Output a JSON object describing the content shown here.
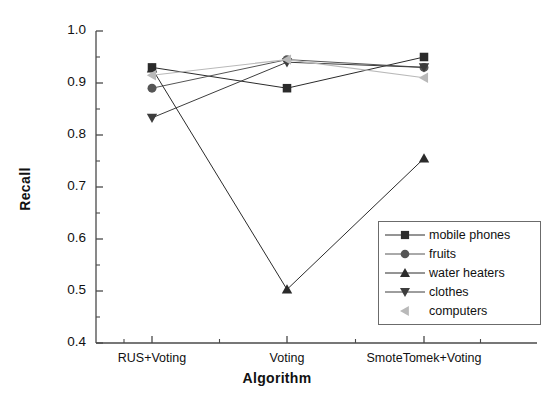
{
  "chart_data": {
    "type": "line",
    "title": "",
    "xlabel": "Algorithm",
    "ylabel": "Recall",
    "categories": [
      "RUS+Voting",
      "Voting",
      "SmoteTomek+Voting"
    ],
    "ylim": [
      0.4,
      1.0
    ],
    "ytick_labels": [
      "0.4",
      "0.5",
      "0.6",
      "0.7",
      "0.8",
      "0.9",
      "1.0"
    ],
    "ytick_values": [
      0.4,
      0.5,
      0.6,
      0.7,
      0.8,
      0.9,
      1.0
    ],
    "ytick_minor_values": [
      0.45,
      0.55,
      0.65,
      0.75,
      0.85,
      0.95
    ],
    "grid": false,
    "legend_position": "lower-right-inside",
    "series": [
      {
        "name": "mobile phones",
        "marker": "square",
        "color": "#2b2b2b",
        "values": [
          0.93,
          0.89,
          0.95
        ]
      },
      {
        "name": "fruits",
        "marker": "circle",
        "color": "#555555",
        "values": [
          0.89,
          0.945,
          0.93
        ]
      },
      {
        "name": "water heaters",
        "marker": "triangle-up",
        "color": "#2b2b2b",
        "values": [
          0.928,
          0.503,
          0.755
        ]
      },
      {
        "name": "clothes",
        "marker": "triangle-down",
        "color": "#3d3d3d",
        "values": [
          0.833,
          0.94,
          0.93
        ]
      },
      {
        "name": "computers",
        "marker": "triangle-left",
        "color": "#b9b9b9",
        "values": [
          0.915,
          0.945,
          0.91
        ]
      }
    ]
  },
  "legend": {
    "items": [
      {
        "label": "mobile phones"
      },
      {
        "label": "fruits"
      },
      {
        "label": "water heaters"
      },
      {
        "label": "clothes"
      },
      {
        "label": "computers"
      }
    ]
  }
}
